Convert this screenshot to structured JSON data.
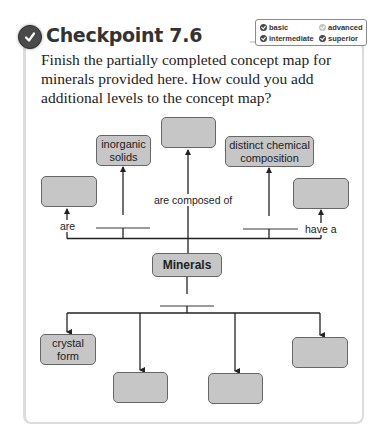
{
  "header": {
    "title": "Checkpoint 7.6",
    "icon": "check-circle-icon"
  },
  "legend": {
    "items": [
      {
        "label": "basic",
        "state": "filled"
      },
      {
        "label": "advanced",
        "state": "unfilled"
      },
      {
        "label": "intermediate",
        "state": "filled"
      },
      {
        "label": "superior",
        "state": "filled"
      }
    ]
  },
  "prompt": "Finish the partially completed concept map for minerals provided here. How could you add additional levels to the concept map?",
  "concept_map": {
    "central": "Minerals",
    "links": {
      "are": "are",
      "are_composed_of": "are composed of",
      "have_a": "have a"
    },
    "upper_nodes": [
      {
        "id": "left",
        "text": ""
      },
      {
        "id": "inorganic",
        "text": "inorganic solids"
      },
      {
        "id": "center",
        "text": ""
      },
      {
        "id": "distinct",
        "text": "distinct chemical composition"
      },
      {
        "id": "right",
        "text": ""
      }
    ],
    "lower_nodes": [
      {
        "id": "crystal",
        "text": "crystal form"
      },
      {
        "id": "lower2",
        "text": ""
      },
      {
        "id": "lower3",
        "text": ""
      },
      {
        "id": "lower4",
        "text": ""
      }
    ],
    "colors": {
      "box_fill": "#c6c6c6",
      "box_border": "#666666",
      "line": "#222222"
    }
  }
}
